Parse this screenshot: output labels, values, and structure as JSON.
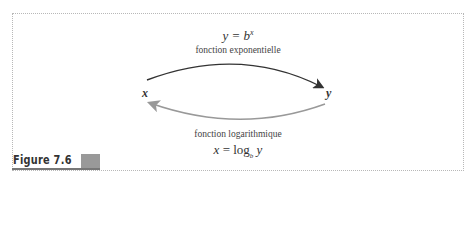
{
  "figure": {
    "label": "Figure 7.6",
    "accent_color": "#999999"
  },
  "diagram": {
    "top_equation": {
      "lhs": "y = b",
      "exponent": "x"
    },
    "top_label": "fonction exponentielle",
    "bottom_label": "fonction logarithmique",
    "bottom_equation": {
      "lhs": "x = log",
      "subscript": "b",
      "arg": " y"
    },
    "left_variable": "x",
    "right_variable": "y",
    "top_arrow_color": "#333333",
    "bottom_arrow_color": "#999999"
  }
}
